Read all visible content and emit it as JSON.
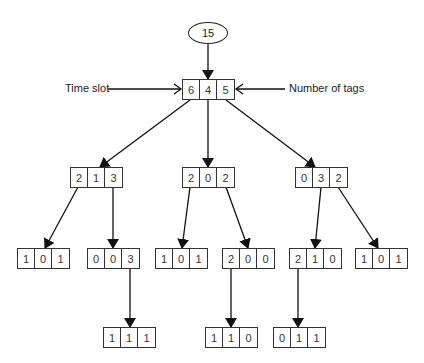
{
  "diagram": {
    "root_value": "15",
    "annotations": {
      "left": "Time slot",
      "right": "Number of tags"
    },
    "nodes": [
      {
        "id": "n0",
        "cells": [
          "6",
          "4",
          "5"
        ],
        "x": 182,
        "y": 79
      },
      {
        "id": "n1",
        "cells": [
          "2",
          "1",
          "3"
        ],
        "x": 70,
        "y": 167
      },
      {
        "id": "n2",
        "cells": [
          "2",
          "0",
          "2"
        ],
        "x": 182,
        "y": 167
      },
      {
        "id": "n3",
        "cells": [
          "0",
          "3",
          "2"
        ],
        "x": 295,
        "y": 167
      },
      {
        "id": "n4",
        "cells": [
          "1",
          "0",
          "1"
        ],
        "x": 17,
        "y": 248
      },
      {
        "id": "n5",
        "cells": [
          "0",
          "0",
          "3"
        ],
        "x": 87,
        "y": 248
      },
      {
        "id": "n6",
        "cells": [
          "1",
          "0",
          "1"
        ],
        "x": 155,
        "y": 248
      },
      {
        "id": "n7",
        "cells": [
          "2",
          "0",
          "0"
        ],
        "x": 222,
        "y": 248
      },
      {
        "id": "n8",
        "cells": [
          "2",
          "1",
          "0"
        ],
        "x": 289,
        "y": 248
      },
      {
        "id": "n9",
        "cells": [
          "1",
          "0",
          "1"
        ],
        "x": 355,
        "y": 248
      },
      {
        "id": "n10",
        "cells": [
          "1",
          "1",
          "1"
        ],
        "x": 103,
        "y": 327
      },
      {
        "id": "n11",
        "cells": [
          "1",
          "1",
          "0"
        ],
        "x": 205,
        "y": 327
      },
      {
        "id": "n12",
        "cells": [
          "0",
          "1",
          "1"
        ],
        "x": 273,
        "y": 327
      }
    ],
    "edges": [
      [
        "root",
        "n0"
      ],
      [
        "n0",
        "n1"
      ],
      [
        "n0",
        "n2"
      ],
      [
        "n0",
        "n3"
      ],
      [
        "n1",
        "n4"
      ],
      [
        "n1",
        "n5"
      ],
      [
        "n2",
        "n6"
      ],
      [
        "n2",
        "n7"
      ],
      [
        "n3",
        "n8"
      ],
      [
        "n3",
        "n9"
      ],
      [
        "n5",
        "n10"
      ],
      [
        "n7",
        "n11"
      ],
      [
        "n8",
        "n12"
      ]
    ]
  }
}
